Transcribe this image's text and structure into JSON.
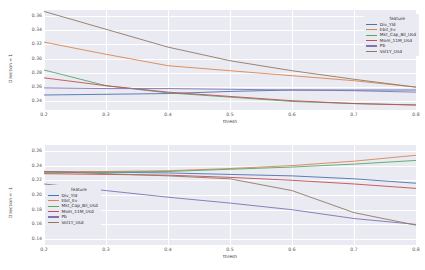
{
  "chart_data": [
    {
      "type": "line",
      "panel": "top",
      "title": "",
      "xlabel": "thresh",
      "ylabel": "Direction = 1",
      "xlim": [
        0.2,
        0.8
      ],
      "ylim": [
        0.228,
        0.368
      ],
      "xticks": [
        "0.2",
        "0.3",
        "0.4",
        "0.5",
        "0.6",
        "0.7",
        "0.8"
      ],
      "xtick_values": [
        0.2,
        0.3,
        0.4,
        0.5,
        0.6,
        0.7,
        0.8
      ],
      "yticks": [
        "0.36",
        "0.34",
        "0.32",
        "0.30",
        "0.28",
        "0.26",
        "0.24"
      ],
      "ytick_values": [
        0.36,
        0.34,
        0.32,
        0.3,
        0.28,
        0.26,
        0.24
      ],
      "grid": true,
      "legend_position": "upper right",
      "legend_title": "feature",
      "x": [
        0.2,
        0.3,
        0.4,
        0.5,
        0.6,
        0.7,
        0.8
      ],
      "series": [
        {
          "name": "Div_Yld",
          "color": "#4c72b0",
          "values": [
            0.249,
            0.25,
            0.251,
            0.254,
            0.256,
            0.256,
            0.256
          ]
        },
        {
          "name": "Ebit_Ev",
          "color": "#dd8452",
          "values": [
            0.323,
            0.306,
            0.29,
            0.283,
            0.276,
            0.269,
            0.26
          ]
        },
        {
          "name": "Mkt_Cap_Bil_Usd",
          "color": "#55a868",
          "values": [
            0.284,
            0.262,
            0.252,
            0.246,
            0.24,
            0.237,
            0.235
          ]
        },
        {
          "name": "Mom_11M_Usd",
          "color": "#c44e52",
          "values": [
            0.273,
            0.262,
            0.253,
            0.247,
            0.241,
            0.237,
            0.235
          ]
        },
        {
          "name": "Pb",
          "color": "#8172b3",
          "values": [
            0.259,
            0.258,
            0.258,
            0.257,
            0.256,
            0.255,
            0.253
          ]
        },
        {
          "name": "Vol1Y_Usd",
          "color": "#937860",
          "values": [
            0.366,
            0.341,
            0.316,
            0.297,
            0.283,
            0.271,
            0.26
          ]
        }
      ]
    },
    {
      "type": "line",
      "panel": "bottom",
      "title": "",
      "xlabel": "thresh",
      "ylabel": "Direction = -1",
      "xlim": [
        0.2,
        0.8
      ],
      "ylim": [
        0.132,
        0.268
      ],
      "xticks": [
        "0.2",
        "0.3",
        "0.4",
        "0.5",
        "0.6",
        "0.7",
        "0.8"
      ],
      "xtick_values": [
        0.2,
        0.3,
        0.4,
        0.5,
        0.6,
        0.7,
        0.8
      ],
      "yticks": [
        "0.26",
        "0.24",
        "0.22",
        "0.20",
        "0.18",
        "0.16",
        "0.14"
      ],
      "ytick_values": [
        0.26,
        0.24,
        0.22,
        0.2,
        0.18,
        0.16,
        0.14
      ],
      "grid": true,
      "legend_position": "lower left",
      "legend_title": "feature",
      "x": [
        0.2,
        0.3,
        0.4,
        0.5,
        0.6,
        0.7,
        0.8
      ],
      "series": [
        {
          "name": "Div_Yld",
          "color": "#4c72b0",
          "values": [
            0.232,
            0.231,
            0.23,
            0.228,
            0.226,
            0.222,
            0.216
          ]
        },
        {
          "name": "Ebit_Ev",
          "color": "#dd8452",
          "values": [
            0.231,
            0.232,
            0.233,
            0.236,
            0.24,
            0.246,
            0.254
          ]
        },
        {
          "name": "Mkt_Cap_Bil_Usd",
          "color": "#55a868",
          "values": [
            0.23,
            0.231,
            0.232,
            0.235,
            0.238,
            0.242,
            0.247
          ]
        },
        {
          "name": "Mom_11M_Usd",
          "color": "#c44e52",
          "values": [
            0.229,
            0.228,
            0.227,
            0.224,
            0.22,
            0.215,
            0.209
          ]
        },
        {
          "name": "Pb",
          "color": "#8172b3",
          "values": [
            0.215,
            0.206,
            0.197,
            0.189,
            0.18,
            0.168,
            0.16
          ]
        },
        {
          "name": "Vol1Y_Usd",
          "color": "#937860",
          "values": [
            0.232,
            0.229,
            0.226,
            0.222,
            0.206,
            0.176,
            0.159
          ]
        }
      ]
    }
  ]
}
